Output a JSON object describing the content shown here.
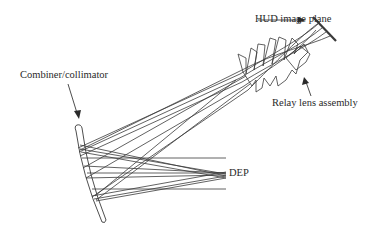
{
  "diagram": {
    "labels": {
      "image_plane": "HUD image plane",
      "relay": "Relay lens assembly",
      "combiner": "Combiner/collimator",
      "dep": "DEP"
    },
    "colors": {
      "line": "#3a3a3a",
      "text": "#2a2a2a",
      "background": "#ffffff"
    }
  }
}
